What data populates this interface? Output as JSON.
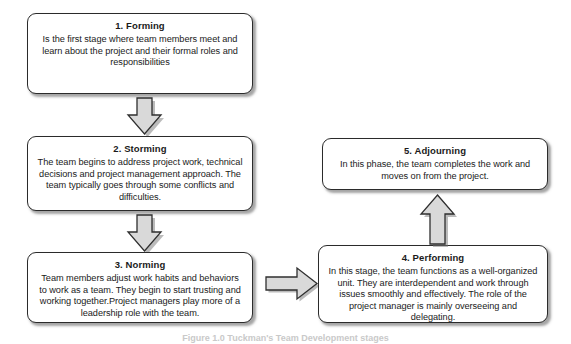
{
  "figure": {
    "background_color": "#ffffff",
    "box_border_color": "#2b2b2b",
    "arrow_fill_color": "#d9d9d9",
    "arrow_border_color": "#2f2f2f",
    "caption": "Figure 1.0 Tuckman's Team Development stages"
  },
  "stages": [
    {
      "id": "forming",
      "title": "1. Forming",
      "body": "Is the first stage where team members meet and learn about the project and their formal roles and responsibilities"
    },
    {
      "id": "storming",
      "title": "2. Storming",
      "body": "The team begins to address project work, technical decisions and project management approach. The team typically goes through some conflicts and difficulties."
    },
    {
      "id": "norming",
      "title": "3. Norming",
      "body": "Team members adjust work habits and behaviors to work as a team. They begin to start trusting and working together.Project managers play more of a leadership role with the team."
    },
    {
      "id": "performing",
      "title": "4. Performing",
      "body": "In this stage, the team  functions as a well-organized unit. They are interdependent and work through issues smoothly and effectively. The role of the project manager is mainly overseeing and delegating."
    },
    {
      "id": "adjourning",
      "title": "5. Adjourning",
      "body": "In this phase, the team completes the work and moves on from the project."
    }
  ],
  "arrows": [
    {
      "id": "forming-to-storming",
      "direction": "down",
      "from": "1. Forming",
      "to": "2. Storming"
    },
    {
      "id": "storming-to-norming",
      "direction": "down",
      "from": "2. Storming",
      "to": "3. Norming"
    },
    {
      "id": "norming-to-performing",
      "direction": "right",
      "from": "3. Norming",
      "to": "4. Performing"
    },
    {
      "id": "performing-to-adjourning",
      "direction": "up",
      "from": "4. Performing",
      "to": "5. Adjourning"
    }
  ]
}
